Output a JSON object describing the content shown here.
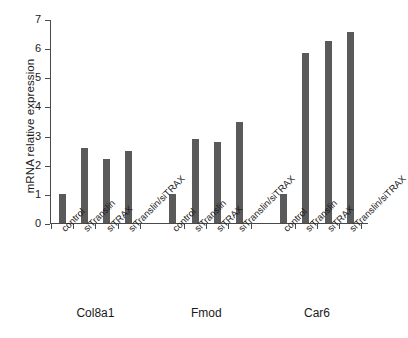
{
  "chart_data": {
    "type": "bar",
    "title": "",
    "subtitle": "",
    "xlabel": "",
    "ylabel": "mRNA  relative expression",
    "ylim": [
      0,
      7
    ],
    "yticks": [
      "0",
      "1",
      "2",
      "3",
      "4",
      "5",
      "6",
      "7"
    ],
    "grid": false,
    "legend": "none",
    "bar_color": "#5a5a5a",
    "axis_color": "#4a4a4a",
    "background_color": "#ffffff",
    "categories": [
      "control",
      "siTranslin",
      "siTRAX",
      "siTranslin/siTRAX"
    ],
    "groups": [
      "Col8a1",
      "Fmod",
      "Car6"
    ],
    "series": [
      {
        "name": "Col8a1",
        "values": [
          1.0,
          2.58,
          2.18,
          2.48
        ]
      },
      {
        "name": "Fmod",
        "values": [
          1.0,
          2.87,
          2.77,
          3.47
        ]
      },
      {
        "name": "Car6",
        "values": [
          0.98,
          5.85,
          6.24,
          6.55
        ]
      }
    ],
    "bars": [
      {
        "group": "Col8a1",
        "category": "control",
        "value": 1.0
      },
      {
        "group": "Col8a1",
        "category": "siTranslin",
        "value": 2.58
      },
      {
        "group": "Col8a1",
        "category": "siTRAX",
        "value": 2.18
      },
      {
        "group": "Col8a1",
        "category": "siTranslin/siTRAX",
        "value": 2.48
      },
      {
        "group": "Fmod",
        "category": "control",
        "value": 1.0
      },
      {
        "group": "Fmod",
        "category": "siTranslin",
        "value": 2.87
      },
      {
        "group": "Fmod",
        "category": "siTRAX",
        "value": 2.77
      },
      {
        "group": "Fmod",
        "category": "siTranslin/siTRAX",
        "value": 3.47
      },
      {
        "group": "Car6",
        "category": "control",
        "value": 0.98
      },
      {
        "group": "Car6",
        "category": "siTranslin",
        "value": 5.85
      },
      {
        "group": "Car6",
        "category": "siTRAX",
        "value": 6.24
      },
      {
        "group": "Car6",
        "category": "siTranslin/siTRAX",
        "value": 6.55
      }
    ]
  }
}
